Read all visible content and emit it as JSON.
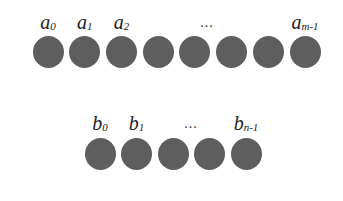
{
  "diagram": {
    "row_a": {
      "circle_count": 8,
      "circle_centers_x": [
        48,
        84.7,
        121.4,
        158.1,
        194.8,
        231.5,
        268.2,
        305
      ],
      "circle_top": 36,
      "labels": [
        {
          "base": "a",
          "sub": "0",
          "x": 48
        },
        {
          "base": "a",
          "sub": "1",
          "x": 84.7
        },
        {
          "base": "a",
          "sub": "2",
          "x": 121.4
        },
        {
          "base": "a",
          "sub": "m-1",
          "x": 305
        }
      ],
      "ellipsis": {
        "text": "...",
        "x": 207
      }
    },
    "row_b": {
      "circle_count": 5,
      "circle_centers_x": [
        100,
        136.5,
        173,
        209.5,
        246
      ],
      "circle_top": 138,
      "labels": [
        {
          "base": "b",
          "sub": "0",
          "x": 100
        },
        {
          "base": "b",
          "sub": "1",
          "x": 136.5
        },
        {
          "base": "b",
          "sub": "n-1",
          "x": 246
        }
      ],
      "ellipsis": {
        "text": "...",
        "x": 191
      }
    },
    "colors": {
      "circle": "#5e5e5e",
      "text": "#222222",
      "background": "#ffffff"
    }
  }
}
